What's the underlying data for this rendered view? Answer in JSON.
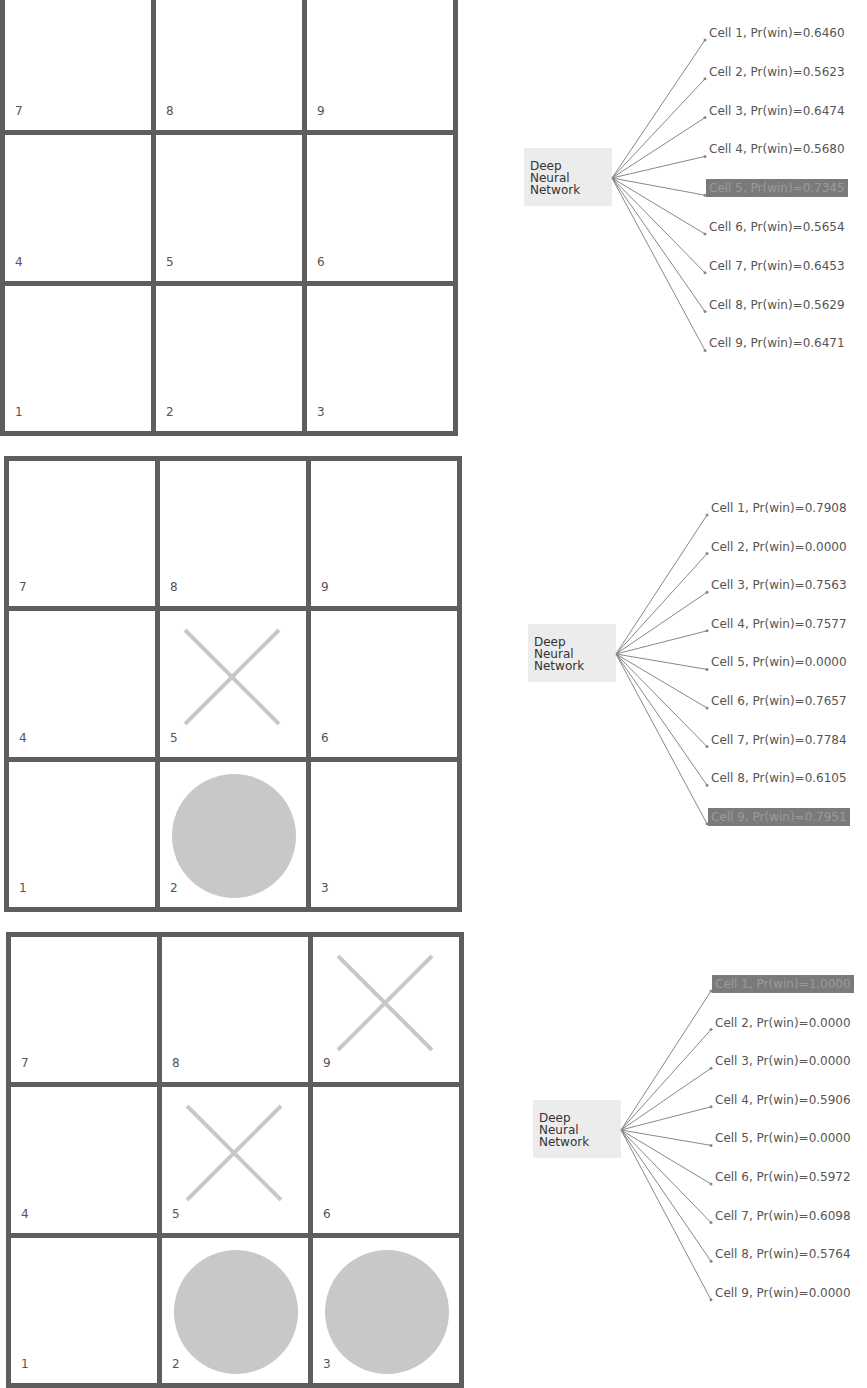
{
  "dnn_label": [
    "Deep",
    "Neural",
    "Network"
  ],
  "colors": {
    "grid": "#5e5e5e",
    "mark": "#c8c8c8",
    "dnn_box": "#ececec",
    "highlight": "#7a7a7a"
  },
  "panels": [
    {
      "board": {
        "cells": [
          {
            "num": "7",
            "mark": ""
          },
          {
            "num": "8",
            "mark": ""
          },
          {
            "num": "9",
            "mark": ""
          },
          {
            "num": "4",
            "mark": ""
          },
          {
            "num": "5",
            "mark": ""
          },
          {
            "num": "6",
            "mark": ""
          },
          {
            "num": "1",
            "mark": ""
          },
          {
            "num": "2",
            "mark": ""
          },
          {
            "num": "3",
            "mark": ""
          }
        ]
      },
      "best_cell": 5,
      "options": [
        {
          "cell": 1,
          "label": "Cell 1, Pr(win)=0.6460"
        },
        {
          "cell": 2,
          "label": "Cell 2, Pr(win)=0.5623"
        },
        {
          "cell": 3,
          "label": "Cell 3, Pr(win)=0.6474"
        },
        {
          "cell": 4,
          "label": "Cell 4, Pr(win)=0.5680"
        },
        {
          "cell": 5,
          "label": "Cell 5, Pr(win)=0.7345"
        },
        {
          "cell": 6,
          "label": "Cell 6, Pr(win)=0.5654"
        },
        {
          "cell": 7,
          "label": "Cell 7, Pr(win)=0.6453"
        },
        {
          "cell": 8,
          "label": "Cell 8, Pr(win)=0.5629"
        },
        {
          "cell": 9,
          "label": "Cell 9, Pr(win)=0.6471"
        }
      ]
    },
    {
      "board": {
        "cells": [
          {
            "num": "7",
            "mark": ""
          },
          {
            "num": "8",
            "mark": ""
          },
          {
            "num": "9",
            "mark": ""
          },
          {
            "num": "4",
            "mark": ""
          },
          {
            "num": "5",
            "mark": "X"
          },
          {
            "num": "6",
            "mark": ""
          },
          {
            "num": "1",
            "mark": ""
          },
          {
            "num": "2",
            "mark": "O"
          },
          {
            "num": "3",
            "mark": ""
          }
        ]
      },
      "best_cell": 9,
      "options": [
        {
          "cell": 1,
          "label": "Cell 1, Pr(win)=0.7908"
        },
        {
          "cell": 2,
          "label": "Cell 2, Pr(win)=0.0000"
        },
        {
          "cell": 3,
          "label": "Cell 3, Pr(win)=0.7563"
        },
        {
          "cell": 4,
          "label": "Cell 4, Pr(win)=0.7577"
        },
        {
          "cell": 5,
          "label": "Cell 5, Pr(win)=0.0000"
        },
        {
          "cell": 6,
          "label": "Cell 6, Pr(win)=0.7657"
        },
        {
          "cell": 7,
          "label": "Cell 7, Pr(win)=0.7784"
        },
        {
          "cell": 8,
          "label": "Cell 8, Pr(win)=0.6105"
        },
        {
          "cell": 9,
          "label": "Cell 9, Pr(win)=0.7951"
        }
      ]
    },
    {
      "board": {
        "cells": [
          {
            "num": "7",
            "mark": ""
          },
          {
            "num": "8",
            "mark": ""
          },
          {
            "num": "9",
            "mark": "X"
          },
          {
            "num": "4",
            "mark": ""
          },
          {
            "num": "5",
            "mark": "X"
          },
          {
            "num": "6",
            "mark": ""
          },
          {
            "num": "1",
            "mark": ""
          },
          {
            "num": "2",
            "mark": "O"
          },
          {
            "num": "3",
            "mark": "O"
          }
        ]
      },
      "best_cell": 1,
      "options": [
        {
          "cell": 1,
          "label": "Cell 1, Pr(win)=1.0000"
        },
        {
          "cell": 2,
          "label": "Cell 2, Pr(win)=0.0000"
        },
        {
          "cell": 3,
          "label": "Cell 3, Pr(win)=0.0000"
        },
        {
          "cell": 4,
          "label": "Cell 4, Pr(win)=0.5906"
        },
        {
          "cell": 5,
          "label": "Cell 5, Pr(win)=0.0000"
        },
        {
          "cell": 6,
          "label": "Cell 6, Pr(win)=0.5972"
        },
        {
          "cell": 7,
          "label": "Cell 7, Pr(win)=0.6098"
        },
        {
          "cell": 8,
          "label": "Cell 8, Pr(win)=0.5764"
        },
        {
          "cell": 9,
          "label": "Cell 9, Pr(win)=0.0000"
        }
      ]
    }
  ]
}
